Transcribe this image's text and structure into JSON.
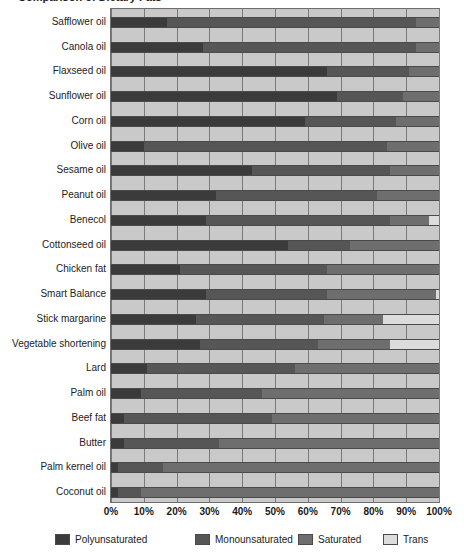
{
  "title": {
    "text": "Comparison of Dietary Fats",
    "truncated": true
  },
  "axis": {
    "xticks": [
      "0%",
      "10%",
      "20%",
      "30%",
      "40%",
      "50%",
      "60%",
      "70%",
      "80%",
      "90%",
      "100%"
    ],
    "xmin": 0,
    "xmax": 100
  },
  "legend": {
    "position": "bottom",
    "items": [
      {
        "label": "Polyunsaturated",
        "color": "#3b3b3b"
      },
      {
        "label": "Monounsaturated",
        "color": "#565656"
      },
      {
        "label": "Saturated",
        "color": "#6e6e6e"
      },
      {
        "label": "Trans",
        "color": "#dcdcdc"
      }
    ]
  },
  "colors": {
    "polyunsaturated": "#3b3b3b",
    "monounsaturated": "#565656",
    "saturated": "#6e6e6e",
    "trans": "#dcdcdc",
    "plot_background": "#c9c9c9",
    "gridline": "#7a7a7a"
  },
  "chart_data": {
    "type": "bar",
    "orientation": "horizontal",
    "stacked": true,
    "normalized_percent": true,
    "title": "Comparison of Dietary Fats",
    "xlabel": "",
    "ylabel": "",
    "xlim": [
      0,
      100
    ],
    "grid": true,
    "legend_position": "bottom",
    "categories": [
      "Safflower oil",
      "Canola oil",
      "Flaxseed oil",
      "Sunflower oil",
      "Corn oil",
      "Olive oil",
      "Sesame oil",
      "Peanut oil",
      "Benecol",
      "Cottonseed oil",
      "Chicken fat",
      "Smart Balance",
      "Stick margarine",
      "Vegetable shortening",
      "Lard",
      "Palm oil",
      "Beef fat",
      "Butter",
      "Palm kernel oil",
      "Coconut oil"
    ],
    "series": [
      {
        "name": "Polyunsaturated",
        "color": "#3b3b3b",
        "values": [
          17,
          28,
          66,
          69,
          59,
          10,
          43,
          32,
          29,
          54,
          21,
          29,
          26,
          27,
          11,
          9,
          4,
          4,
          2,
          2
        ]
      },
      {
        "name": "Monounsaturated",
        "color": "#565656",
        "values": [
          76,
          65,
          25,
          20,
          28,
          74,
          42,
          49,
          56,
          19,
          45,
          37,
          39,
          36,
          45,
          37,
          45,
          29,
          14,
          7
        ]
      },
      {
        "name": "Saturated",
        "color": "#6e6e6e",
        "values": [
          7,
          7,
          9,
          11,
          13,
          16,
          15,
          19,
          12,
          27,
          34,
          33,
          18,
          22,
          44,
          54,
          51,
          67,
          84,
          91
        ]
      },
      {
        "name": "Trans",
        "color": "#dcdcdc",
        "values": [
          0,
          0,
          0,
          0,
          0,
          0,
          0,
          0,
          3,
          0,
          0,
          1,
          17,
          15,
          0,
          0,
          0,
          0,
          0,
          0
        ]
      }
    ]
  }
}
